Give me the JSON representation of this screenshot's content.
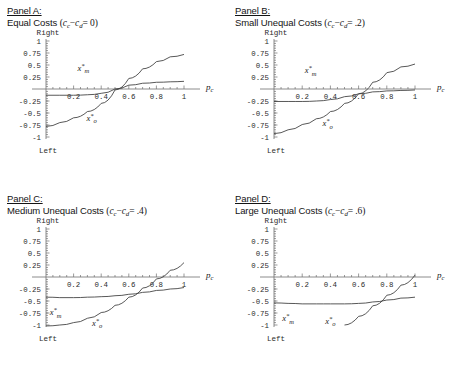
{
  "figure": {
    "panels": [
      {
        "id": "A",
        "panel_label": "Panel A:",
        "condition": "Equal Costs",
        "param_open": "(",
        "param_c": "c",
        "param_c_sub": "c",
        "param_minus": "−",
        "param_d": "c",
        "param_d_sub": "d",
        "param_eq": "= 0",
        "param_close": ")"
      },
      {
        "id": "B",
        "panel_label": "Panel B:",
        "condition": "Small Unequal Costs",
        "param_open": "(",
        "param_c": "c",
        "param_c_sub": "c",
        "param_minus": "−",
        "param_d": "c",
        "param_d_sub": "d",
        "param_eq": "= .2",
        "param_close": ")"
      },
      {
        "id": "C",
        "panel_label": "Panel C:",
        "condition": "Medium Unequal Costs",
        "param_open": "(",
        "param_c": "c",
        "param_c_sub": "c",
        "param_minus": "−",
        "param_d": "c",
        "param_d_sub": "d",
        "param_eq": "= .4",
        "param_close": ")"
      },
      {
        "id": "D",
        "panel_label": "Panel D:",
        "condition": "Large Unequal Costs",
        "param_open": "(",
        "param_c": "c",
        "param_c_sub": "c",
        "param_minus": "−",
        "param_d": "c",
        "param_d_sub": "d",
        "param_eq": "= .6",
        "param_close": ")"
      }
    ]
  },
  "axes": {
    "ytop_label": "Right",
    "ybottom_label": "Left",
    "xaxis_var": "p",
    "xaxis_var_sub": "c",
    "ytick_labels": [
      "1",
      "0.75",
      "0.5",
      "0.25",
      "-0.25",
      "-0.5",
      "-0.75",
      "-1"
    ],
    "ytick_values": [
      1,
      0.75,
      0.5,
      0.25,
      -0.25,
      -0.5,
      -0.75,
      -1
    ],
    "xtick_labels": [
      "0.2",
      "0.4",
      "0.6",
      "0.8",
      "1"
    ],
    "xtick_values": [
      0.2,
      0.4,
      0.6,
      0.8,
      1
    ],
    "xlim": [
      0,
      1.06
    ],
    "ylim": [
      -1.06,
      1.06
    ],
    "curve_labels": {
      "xm": "x",
      "xm_sub": "m",
      "xo": "x",
      "xo_sub": "o",
      "star": "*"
    }
  },
  "chart_data": [
    {
      "type": "line",
      "title": "Panel A: Equal Costs (c_c - c_d = 0)",
      "xlabel": "p_c",
      "ylabel": "Right / Left",
      "xlim": [
        0,
        1
      ],
      "ylim": [
        -1,
        1
      ],
      "grid": false,
      "legend": "inline-curve-labels",
      "x": [
        0,
        0.1,
        0.2,
        0.3,
        0.4,
        0.5,
        0.6,
        0.7,
        0.8,
        0.9,
        1
      ],
      "series": [
        {
          "name": "x*_m",
          "label_pos": [
            0.27,
            0.38
          ],
          "values": [
            -0.13,
            -0.13,
            -0.13,
            -0.12,
            -0.09,
            0.0,
            0.08,
            0.12,
            0.14,
            0.15,
            0.16
          ]
        },
        {
          "name": "x*_o",
          "label_pos": [
            0.33,
            -0.66
          ],
          "values": [
            -0.78,
            -0.7,
            -0.6,
            -0.47,
            -0.3,
            -0.02,
            0.22,
            0.42,
            0.57,
            0.67,
            0.72
          ]
        }
      ]
    },
    {
      "type": "line",
      "title": "Panel B: Small Unequal Costs (c_c - c_d = .2)",
      "xlabel": "p_c",
      "ylabel": "Right / Left",
      "xlim": [
        0,
        1
      ],
      "ylim": [
        -1,
        1
      ],
      "grid": false,
      "legend": "inline-curve-labels",
      "x": [
        0,
        0.1,
        0.2,
        0.3,
        0.4,
        0.5,
        0.6,
        0.7,
        0.8,
        0.9,
        1
      ],
      "series": [
        {
          "name": "x*_m",
          "label_pos": [
            0.26,
            0.33
          ],
          "values": [
            -0.26,
            -0.26,
            -0.26,
            -0.25,
            -0.22,
            -0.16,
            -0.1,
            -0.06,
            -0.04,
            -0.03,
            -0.02
          ]
        },
        {
          "name": "x*_o",
          "label_pos": [
            0.38,
            -0.78
          ],
          "values": [
            -0.93,
            -0.85,
            -0.74,
            -0.62,
            -0.47,
            -0.3,
            -0.1,
            0.14,
            0.34,
            0.46,
            0.52
          ]
        }
      ]
    },
    {
      "type": "line",
      "title": "Panel C: Medium Unequal Costs (c_c - c_d = .4)",
      "xlabel": "p_c",
      "ylabel": "Right / Left",
      "xlim": [
        0,
        1
      ],
      "ylim": [
        -1,
        1
      ],
      "grid": false,
      "legend": "inline-curve-labels",
      "x": [
        0,
        0.1,
        0.2,
        0.3,
        0.4,
        0.5,
        0.6,
        0.7,
        0.8,
        0.9,
        1
      ],
      "series": [
        {
          "name": "x*_m",
          "label_pos": [
            0.07,
            -0.8
          ],
          "values": [
            -0.42,
            -0.43,
            -0.43,
            -0.42,
            -0.41,
            -0.39,
            -0.36,
            -0.32,
            -0.28,
            -0.25,
            -0.22
          ]
        },
        {
          "name": "x*_o",
          "label_pos": [
            0.37,
            -1.02
          ],
          "values": [
            -1.02,
            -1.0,
            -0.95,
            -0.86,
            -0.74,
            -0.59,
            -0.42,
            -0.23,
            -0.04,
            0.14,
            0.3
          ]
        }
      ]
    },
    {
      "type": "line",
      "title": "Panel D: Large Unequal Costs (c_c - c_d = .6)",
      "xlabel": "p_c",
      "ylabel": "Right / Left",
      "xlim": [
        0,
        1
      ],
      "ylim": [
        -1,
        1
      ],
      "grid": false,
      "legend": "inline-curve-labels",
      "x": [
        0,
        0.1,
        0.2,
        0.3,
        0.4,
        0.5,
        0.6,
        0.7,
        0.8,
        0.9,
        1
      ],
      "series": [
        {
          "name": "x*_m",
          "label_pos": [
            0.1,
            -0.92
          ],
          "values": [
            -0.54,
            -0.55,
            -0.56,
            -0.56,
            -0.56,
            -0.56,
            -0.55,
            -0.52,
            -0.48,
            -0.44,
            -0.42
          ]
        },
        {
          "name": "x*_o",
          "label_pos": [
            0.4,
            -0.98
          ],
          "values": [
            null,
            null,
            null,
            null,
            null,
            -1.0,
            -0.82,
            -0.6,
            -0.38,
            -0.17,
            0.04
          ]
        }
      ]
    }
  ]
}
